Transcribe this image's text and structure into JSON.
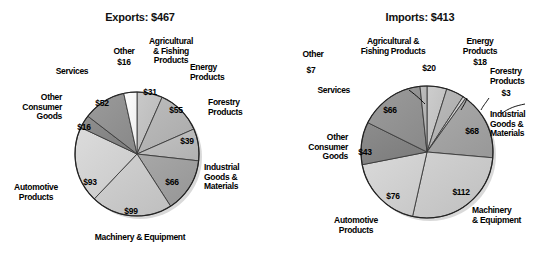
{
  "page": {
    "background": "#ffffff",
    "accent": "#000000"
  },
  "charts": {
    "exports": {
      "title": "Exports: $467",
      "center": {
        "x": 137,
        "y": 154
      },
      "radius": 62
    },
    "imports": {
      "title": "Imports: $413",
      "center": {
        "x": 427,
        "y": 152
      },
      "radius": 66
    }
  },
  "chart_data": [
    {
      "type": "pie",
      "title": "Exports: $467",
      "total": 467,
      "unit": "billions of dollars",
      "value_prefix": "$",
      "start_angle_deg": -90,
      "direction": "clockwise",
      "labels": [
        "Agricultural & Fishing Products",
        "Energy Products",
        "Forestry Products",
        "Industrial Goods & Materials",
        "Machinery & Equipment",
        "Automotive Products",
        "Other Consumer Goods",
        "Services",
        "Other"
      ],
      "values": [
        31,
        55,
        39,
        66,
        99,
        93,
        16,
        52,
        16
      ],
      "value_labels": [
        "$31",
        "$55",
        "$39",
        "$66",
        "$99",
        "$93",
        "$16",
        "$52",
        "$16"
      ],
      "colors": [
        "#c9c9c9",
        "#bdbdbd",
        "#c4c4c4",
        "#a8a8a8",
        "#d2d2d2",
        "#dcdcdc",
        "#8f8f8f",
        "#9b9b9b",
        "#ffffff"
      ],
      "legend": "none",
      "grid": false
    },
    {
      "type": "pie",
      "title": "Imports: $413",
      "total": 413,
      "unit": "billions of dollars",
      "value_prefix": "$",
      "start_angle_deg": -90,
      "direction": "clockwise",
      "labels": [
        "Agricultural & Fishing Products",
        "Energy Products",
        "Forestry Products",
        "Industrial Goods & Materials",
        "Machinery & Equipment",
        "Automotive Products",
        "Other Consumer Goods",
        "Services",
        "Other"
      ],
      "values": [
        20,
        18,
        3,
        68,
        112,
        76,
        43,
        66,
        7
      ],
      "value_labels": [
        "$20",
        "$18",
        "$3",
        "$68",
        "$112",
        "$76",
        "$43",
        "$66",
        "$7"
      ],
      "colors": [
        "#cdcdcd",
        "#bcbcbc",
        "#d6d6d6",
        "#ababab",
        "#d2d2d2",
        "#dadada",
        "#8d8d8d",
        "#9c9c9c",
        "#bfbfbf"
      ],
      "legend": "none",
      "grid": false
    }
  ],
  "exports_labels": {
    "other": "Other",
    "other_value": "$16",
    "services": "Services",
    "services_value": "$52",
    "other_consumer_goods": "Other\nConsumer\nGoods",
    "other_consumer_goods_value": "$16",
    "automotive_products": "Automotive\nProducts",
    "automotive_products_value": "$93",
    "machinery_equipment": "Machinery & Equipment",
    "machinery_equipment_value": "$99",
    "industrial_goods": "Industrial\nGoods &\nMaterials",
    "industrial_goods_value": "$66",
    "forestry_products": "Forestry\nProducts",
    "forestry_products_value": "$39",
    "energy_products": "Energy\nProducts",
    "energy_products_value": "$55",
    "agricultural_fishing": "Agricultural\n& Fishing\nProducts",
    "agricultural_fishing_value": "$31"
  },
  "imports_labels": {
    "other": "Other",
    "other_value": "$7",
    "services": "Services",
    "services_value": "$66",
    "other_consumer_goods": "Other\nConsumer\nGoods",
    "other_consumer_goods_value": "$43",
    "automotive_products": "Automotive\nProducts",
    "automotive_products_value": "$76",
    "machinery_equipment": "Machinery\n& Equipment",
    "machinery_equipment_value": "$112",
    "industrial_goods": "Industrial\nGoods &\nMaterials",
    "industrial_goods_value": "$68",
    "forestry_products": "Forestry\nProducts",
    "forestry_products_value": "$3",
    "energy_products": "Energy\nProducts",
    "energy_products_value": "$18",
    "agricultural_fishing": "Agricultural &\nFishing Products",
    "agricultural_fishing_value": "$20"
  }
}
